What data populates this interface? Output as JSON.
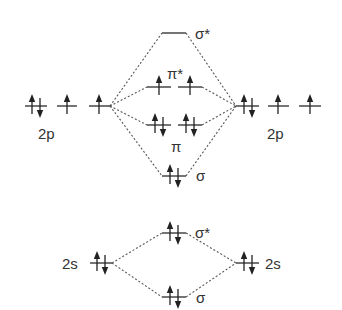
{
  "labels": {
    "left_2p": "2p",
    "right_2p": "2p",
    "left_2s": "2s",
    "right_2s": "2s",
    "sigma_star_2p": "σ*",
    "pi_star_2p": "π*",
    "pi_2p": "π",
    "sigma_2p": "σ",
    "sigma_star_2s": "σ*",
    "sigma_2s": "σ"
  },
  "levels": {
    "left_2p": [
      {
        "x": 25,
        "electrons": "updown"
      },
      {
        "x": 57,
        "electrons": "up"
      },
      {
        "x": 89,
        "electrons": "up"
      }
    ],
    "right_2p": [
      {
        "x": 236,
        "electrons": "updown"
      },
      {
        "x": 268,
        "electrons": "up"
      },
      {
        "x": 299,
        "electrons": "up"
      }
    ],
    "sigma_star_2p": {
      "electrons": "empty"
    },
    "pi_star_2p": [
      {
        "electrons": "up"
      },
      {
        "electrons": "up"
      }
    ],
    "pi_2p": [
      {
        "electrons": "updown"
      },
      {
        "electrons": "updown"
      }
    ],
    "sigma_2p": {
      "electrons": "updown"
    },
    "left_2s": {
      "electrons": "updown"
    },
    "right_2s": {
      "electrons": "updown"
    },
    "sigma_star_2s": {
      "electrons": "updown"
    },
    "sigma_2s": {
      "electrons": "updown"
    }
  }
}
